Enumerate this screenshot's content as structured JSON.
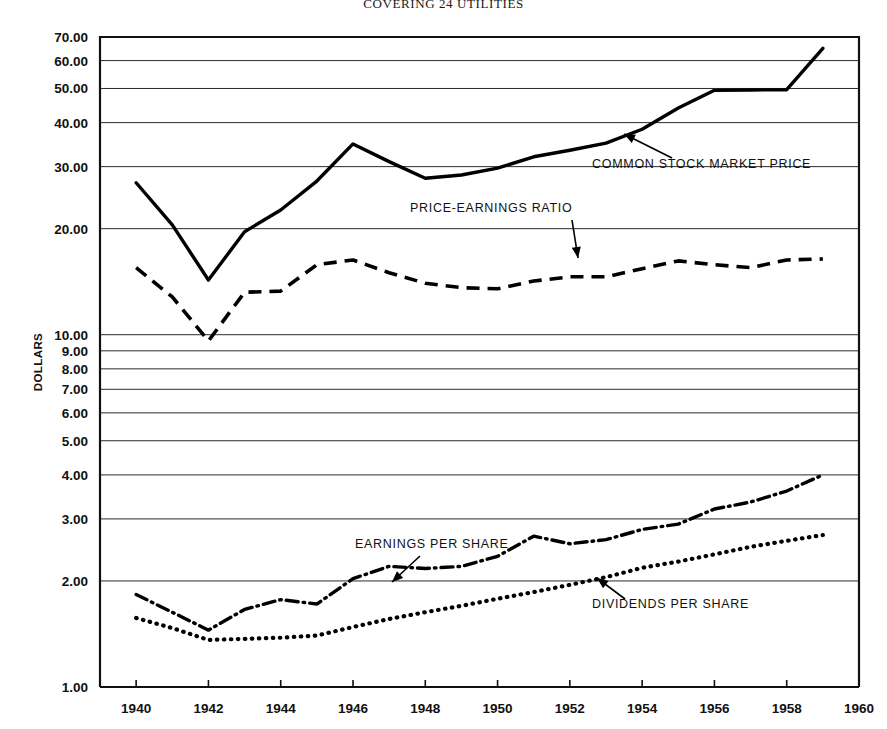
{
  "title": "COVERING 24 UTILITIES",
  "axis": {
    "ylabel": "DOLLARS",
    "xlabel": "",
    "y_ticks": [
      "70.00",
      "60.00",
      "50.00",
      "40.00",
      "30.00",
      "20.00",
      "10.00",
      "9.00",
      "8.00",
      "7.00",
      "6.00",
      "5.00",
      "4.00",
      "3.00",
      "2.00",
      "1.00"
    ],
    "x_ticks": [
      "1940",
      "1942",
      "1944",
      "1946",
      "1948",
      "1950",
      "1952",
      "1954",
      "1956",
      "1958",
      "1960"
    ]
  },
  "annotations": {
    "price": "COMMON STOCK MARKET PRICE",
    "pe": "PRICE-EARNINGS RATIO",
    "eps": "EARNINGS PER SHARE",
    "dps": "DIVIDENDS PER SHARE"
  },
  "chart_data": {
    "type": "line",
    "title": "COVERING 24 UTILITIES",
    "xlabel": "",
    "ylabel": "DOLLARS",
    "yscale": "log",
    "ylim": [
      1.0,
      70.0
    ],
    "xlim": [
      1939,
      1960
    ],
    "grid": true,
    "legend": "annotations-inline",
    "ytick_values": [
      70,
      60,
      50,
      40,
      30,
      20,
      10,
      9,
      8,
      7,
      6,
      5,
      4,
      3,
      2,
      1
    ],
    "xtick_values": [
      1940,
      1942,
      1944,
      1946,
      1948,
      1950,
      1952,
      1954,
      1956,
      1958,
      1960
    ],
    "x": [
      1940,
      1941,
      1942,
      1943,
      1944,
      1945,
      1946,
      1947,
      1948,
      1949,
      1950,
      1951,
      1952,
      1953,
      1954,
      1955,
      1956,
      1957,
      1958,
      1959
    ],
    "series": [
      {
        "name": "COMMON STOCK MARKET PRICE",
        "style": "solid",
        "values": [
          27.0,
          20.5,
          14.3,
          19.6,
          22.6,
          27.3,
          34.8,
          31.0,
          27.8,
          28.4,
          29.7,
          32.0,
          33.4,
          35.0,
          38.3,
          44.0,
          49.4,
          49.5,
          49.6,
          65.0
        ]
      },
      {
        "name": "PRICE-EARNINGS RATIO",
        "style": "dashed",
        "values": [
          15.5,
          12.8,
          9.6,
          13.2,
          13.3,
          15.8,
          16.3,
          15.0,
          14.0,
          13.6,
          13.5,
          14.2,
          14.6,
          14.6,
          15.4,
          16.2,
          15.8,
          15.5,
          16.3,
          16.4
        ]
      },
      {
        "name": "EARNINGS PER SHARE",
        "style": "dashdot",
        "values": [
          1.83,
          1.63,
          1.45,
          1.66,
          1.77,
          1.72,
          2.03,
          2.2,
          2.17,
          2.2,
          2.35,
          2.68,
          2.55,
          2.62,
          2.8,
          2.9,
          3.2,
          3.35,
          3.6,
          4.0
        ]
      },
      {
        "name": "DIVIDENDS PER SHARE",
        "style": "dotted",
        "values": [
          1.57,
          1.47,
          1.36,
          1.37,
          1.38,
          1.4,
          1.48,
          1.56,
          1.63,
          1.7,
          1.78,
          1.86,
          1.95,
          2.05,
          2.18,
          2.27,
          2.38,
          2.5,
          2.6,
          2.7
        ]
      }
    ]
  }
}
